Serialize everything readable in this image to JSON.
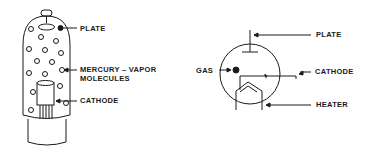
{
  "left_diagram": {
    "title": "Mercury-vapor tube pictorial",
    "labels": {
      "plate": "PLATE",
      "mercury_line1": "MERCURY  –  VAPOR",
      "mercury_line2": "MOLECULES",
      "cathode": "CATHODE"
    }
  },
  "right_diagram": {
    "title": "Gas tube schematic symbol",
    "labels": {
      "plate": "PLATE",
      "gas": "GAS",
      "cathode": "CATHODE",
      "heater": "HEATER"
    }
  },
  "colors": {
    "ink": "#1a1a1a",
    "background": "#ffffff"
  }
}
